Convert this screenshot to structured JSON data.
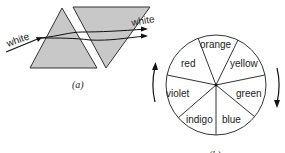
{
  "figure_a": {
    "caption": "(a)",
    "incoming_label": "white",
    "outgoing_label": "white",
    "prism_fill": "#c8c8c8"
  },
  "figure_b": {
    "caption": "(b)",
    "sectors": [
      "orange",
      "yellow",
      "green",
      "blue",
      "indigo",
      "violet",
      "red"
    ]
  }
}
